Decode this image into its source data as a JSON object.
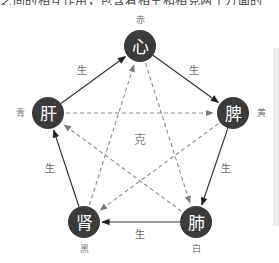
{
  "top_text": "之间的相互作用，包含着相生和相克两个方面的关系",
  "diagram": {
    "center_label": "克",
    "nodes": [
      {
        "id": "heart",
        "label": "心",
        "color_label": "赤",
        "x": 140,
        "y": 46,
        "lx": 140,
        "ly": 20
      },
      {
        "id": "spleen",
        "label": "脾",
        "color_label": "黄",
        "x": 233,
        "y": 113,
        "lx": 261,
        "ly": 113
      },
      {
        "id": "lung",
        "label": "肺",
        "color_label": "白",
        "x": 196,
        "y": 222,
        "lx": 196,
        "ly": 249
      },
      {
        "id": "kidney",
        "label": "肾",
        "color_label": "黑",
        "x": 84,
        "y": 222,
        "lx": 84,
        "ly": 249
      },
      {
        "id": "liver",
        "label": "肝",
        "color_label": "青",
        "x": 48,
        "y": 113,
        "lx": 20,
        "ly": 113
      }
    ],
    "sheng_label": "生",
    "sheng_edges": [
      {
        "from": "liver",
        "to": "heart",
        "label": "生",
        "lx": 82,
        "ly": 70
      },
      {
        "from": "heart",
        "to": "spleen",
        "label": "生",
        "lx": 194,
        "ly": 70
      },
      {
        "from": "spleen",
        "to": "lung",
        "label": "生",
        "lx": 226,
        "ly": 168
      },
      {
        "from": "lung",
        "to": "kidney",
        "label": "生",
        "lx": 140,
        "ly": 234
      },
      {
        "from": "kidney",
        "to": "liver",
        "label": "生",
        "lx": 50,
        "ly": 168
      }
    ],
    "ke_edges": [
      {
        "from": "liver",
        "to": "spleen"
      },
      {
        "from": "spleen",
        "to": "kidney"
      },
      {
        "from": "kidney",
        "to": "heart"
      },
      {
        "from": "heart",
        "to": "lung"
      },
      {
        "from": "lung",
        "to": "liver"
      }
    ],
    "colors": {
      "node_fill": "#3b3b3b",
      "node_text": "#ffffff",
      "sheng_line": "#333333",
      "ke_line": "#8a8a8a"
    }
  }
}
